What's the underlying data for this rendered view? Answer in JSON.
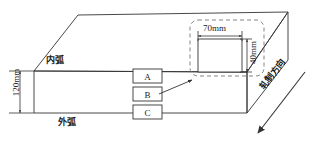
{
  "diagram": {
    "type": "engineering-3d-block-diagram",
    "stroke_color": "#333333",
    "background": "#ffffff"
  },
  "labels": {
    "inner_arc": "内弧",
    "outer_arc": "外弧",
    "rolling_direction": "轧制方向"
  },
  "dimensions": {
    "slab_thickness": "120mm",
    "sample_width": "70mm",
    "sample_height": "40mm"
  },
  "samples": [
    {
      "id": "A"
    },
    {
      "id": "B"
    },
    {
      "id": "C"
    }
  ],
  "callout": {
    "style": "dashed-rounded-rectangle",
    "width_label": "70mm",
    "height_label": "40mm"
  }
}
